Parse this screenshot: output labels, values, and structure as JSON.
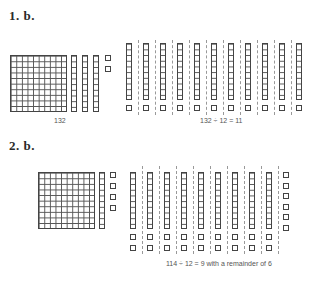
{
  "problems": [
    {
      "heading": "1. b.",
      "dividend_label": "132",
      "equation": "132 ÷ 12 = 11",
      "dividend": {
        "hundreds": 1,
        "tens": 3,
        "ones": 2
      },
      "divisor": 12,
      "groups": 11,
      "group_composition": {
        "tens": 1,
        "ones": 1
      },
      "remainder": 0
    },
    {
      "heading": "2. b.",
      "equation": "114 ÷ 12 = 9 with a remainder of 6",
      "dividend": {
        "hundreds": 1,
        "tens": 1,
        "ones": 4
      },
      "divisor": 12,
      "groups": 9,
      "group_composition": {
        "tens": 1,
        "ones": 2
      },
      "remainder": 6
    }
  ],
  "colors": {
    "ink": "#444444",
    "separator": "#999999",
    "background": "#ffffff"
  }
}
